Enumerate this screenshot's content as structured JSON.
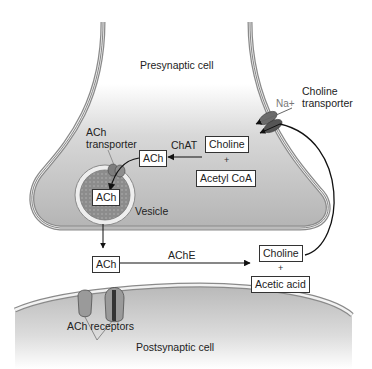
{
  "diagram": {
    "regions": {
      "presynaptic": "Presynaptic cell",
      "postsynaptic": "Postsynaptic cell"
    },
    "labels": {
      "choline_transporter": "Choline\ntransporter",
      "choline_transporter_line1": "Choline",
      "choline_transporter_line2": "transporter",
      "na": "Na+",
      "ach_transporter_line1": "ACh",
      "ach_transporter_line2": "transporter",
      "chat": "ChAT",
      "vesicle": "Vesicle",
      "ache": "AChE",
      "ach_receptors": "ACh receptors",
      "plus": "+"
    },
    "boxes": {
      "choline_top": "Choline",
      "acetyl_coa": "Acetyl CoA",
      "ach_cytosol": "ACh",
      "ach_vesicle": "ACh",
      "ach_cleft": "ACh",
      "choline_cleft": "Choline",
      "acetic_acid": "Acetic acid"
    },
    "colors": {
      "cell_fill_top": "#ffffff",
      "cell_fill_bottom": "#bdbdbd",
      "membrane": "#8a8a8a",
      "arrow": "#111111"
    }
  }
}
